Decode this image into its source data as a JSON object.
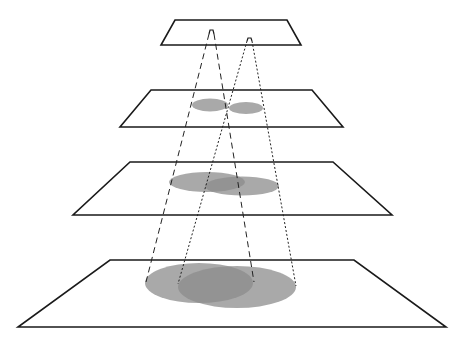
{
  "diagram": {
    "title": "",
    "colors": {
      "background": "#ffffff",
      "plane_stroke": "#1a1a1a",
      "footprint_fill": "#8c8c8c",
      "footprint_opacity": 0.75,
      "cone_line": "#222222"
    },
    "planes": [
      {
        "name": "plane-1",
        "points": [
          [
            175,
            20
          ],
          [
            287,
            20
          ],
          [
            301,
            45
          ],
          [
            161,
            45
          ]
        ]
      },
      {
        "name": "plane-2",
        "points": [
          [
            151,
            90
          ],
          [
            312,
            90
          ],
          [
            343,
            127
          ],
          [
            120,
            127
          ]
        ]
      },
      {
        "name": "plane-3",
        "points": [
          [
            130,
            162
          ],
          [
            333,
            162
          ],
          [
            392,
            215
          ],
          [
            73,
            215
          ]
        ]
      },
      {
        "name": "plane-4",
        "points": [
          [
            110,
            260
          ],
          [
            354,
            260
          ],
          [
            446,
            327
          ],
          [
            18,
            327
          ]
        ]
      }
    ],
    "sources": [
      {
        "name": "source-a",
        "style": "long-dash",
        "arch": [
          [
            209,
            34
          ],
          [
            210,
            30
          ],
          [
            213,
            30
          ],
          [
            214,
            34
          ]
        ]
      },
      {
        "name": "source-b",
        "style": "dotted",
        "arch": [
          [
            247,
            41
          ],
          [
            248,
            38
          ],
          [
            251,
            38
          ],
          [
            252,
            41
          ]
        ]
      }
    ],
    "cones": [
      {
        "name": "cone-a",
        "style": "long-dash",
        "dash": "6,4",
        "left": [
          [
            209,
            34
          ],
          [
            146,
            282
          ]
        ],
        "right": [
          [
            214,
            34
          ],
          [
            254,
            282
          ]
        ]
      },
      {
        "name": "cone-b",
        "style": "dotted",
        "dash": "2,2",
        "left": [
          [
            247,
            41
          ],
          [
            178,
            284
          ]
        ],
        "right": [
          [
            252,
            41
          ],
          [
            296,
            286
          ]
        ]
      }
    ],
    "footprints": [
      {
        "name": "footprint-a-plane-2",
        "cx": 210,
        "cy": 105,
        "rx": 18,
        "ry": 6.5
      },
      {
        "name": "footprint-b-plane-2",
        "cx": 246,
        "cy": 108,
        "rx": 17,
        "ry": 6
      },
      {
        "name": "footprint-a-plane-3",
        "cx": 207,
        "cy": 182,
        "rx": 38,
        "ry": 10
      },
      {
        "name": "footprint-b-plane-3",
        "cx": 242,
        "cy": 186,
        "rx": 37,
        "ry": 9.5
      },
      {
        "name": "footprint-a-plane-4",
        "cx": 199,
        "cy": 283,
        "rx": 54,
        "ry": 20
      },
      {
        "name": "footprint-b-plane-4",
        "cx": 237,
        "cy": 287,
        "rx": 59,
        "ry": 21
      }
    ]
  }
}
